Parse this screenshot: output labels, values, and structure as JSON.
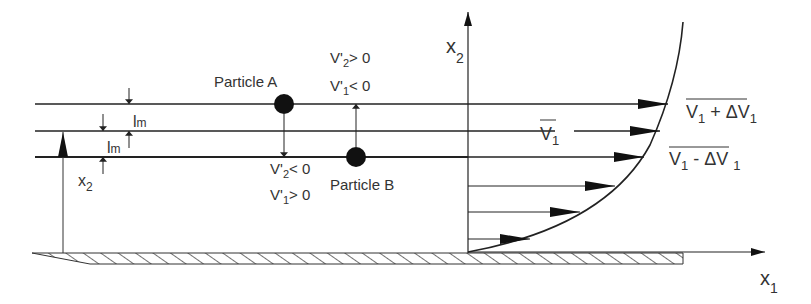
{
  "diagram": {
    "type": "mixing-length turbulent boundary layer",
    "colors": {
      "stroke": "#222222",
      "text": "#333333",
      "background": "#ffffff"
    },
    "axes": {
      "vertical": {
        "label": "x",
        "sub": "2"
      },
      "horizontal": {
        "label": "x",
        "sub": "1"
      }
    },
    "particles": [
      {
        "id": "A",
        "label": "Particle  A",
        "conditions": [
          {
            "var": "V'",
            "sub": "2",
            "rel": "> 0"
          },
          {
            "var": "V'",
            "sub": "1",
            "rel": "< 0"
          }
        ]
      },
      {
        "id": "B",
        "label": "Particle B",
        "conditions": [
          {
            "var": "V'",
            "sub": "2",
            "rel": "< 0"
          },
          {
            "var": "V'",
            "sub": "1",
            "rel": "> 0"
          }
        ]
      }
    ],
    "mixing_length": {
      "label": "l",
      "sub": "m"
    },
    "height_marker": {
      "label": "x",
      "sub": "2"
    },
    "velocity_labels": {
      "upper": {
        "text1": "V",
        "sub1": "1",
        "op": " + ΔV",
        "sub2": "1"
      },
      "mean": {
        "text": "V",
        "sub": "1"
      },
      "lower": {
        "text1": "V",
        "sub1": "1",
        "op": " - ΔV ",
        "sub2": "1"
      }
    }
  }
}
